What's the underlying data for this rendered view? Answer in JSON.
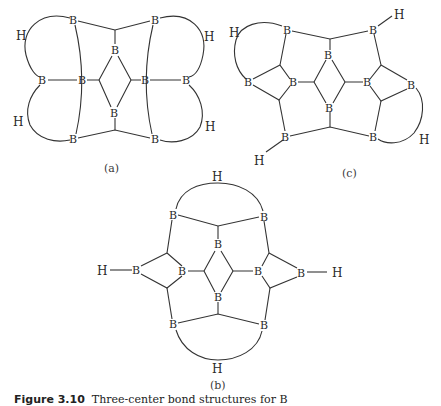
{
  "figure": {
    "caption_label": "Figure 3.10",
    "caption_text": "Three-center bond structures for B",
    "subfigures": [
      {
        "id": "a",
        "label": "(a)"
      },
      {
        "id": "b",
        "label": "(b)"
      },
      {
        "id": "c",
        "label": "(c)"
      }
    ],
    "atom_symbols": {
      "boron": "B",
      "hydrogen": "H"
    }
  }
}
